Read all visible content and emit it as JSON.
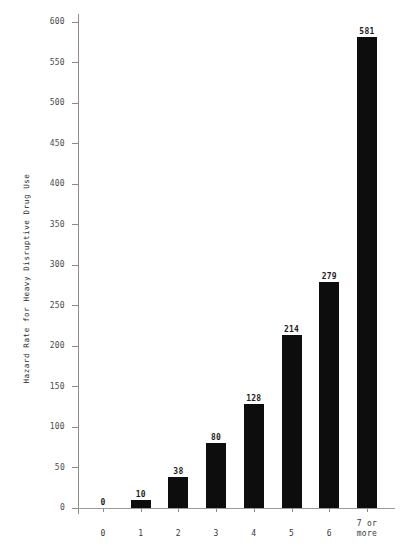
{
  "chart_data": {
    "type": "bar",
    "title": "",
    "xlabel": "",
    "ylabel": "Hazard Rate for Heavy Disruptive Drug Use",
    "categories": [
      "0",
      "1",
      "2",
      "3",
      "4",
      "5",
      "6",
      "7 or more"
    ],
    "category_lines": [
      [
        "0"
      ],
      [
        "1"
      ],
      [
        "2"
      ],
      [
        "3"
      ],
      [
        "4"
      ],
      [
        "5"
      ],
      [
        "6"
      ],
      [
        "7 or",
        "more"
      ]
    ],
    "values": [
      0,
      10,
      38,
      80,
      128,
      214,
      279,
      581
    ],
    "value_labels": [
      "0",
      "10",
      "38",
      "80",
      "128",
      "214",
      "279",
      "581"
    ],
    "ylim": [
      0,
      600
    ],
    "yticks": [
      0,
      50,
      100,
      150,
      200,
      250,
      300,
      350,
      400,
      450,
      500,
      550,
      600
    ],
    "ytick_labels": [
      "0",
      "50",
      "100",
      "150",
      "200",
      "250",
      "300",
      "350",
      "400",
      "450",
      "500",
      "550",
      "600"
    ],
    "grid": false,
    "legend": null,
    "bar_color": "#0d0d0d",
    "axis_color": "#8c8c8c",
    "background_color": "#ffffff"
  }
}
